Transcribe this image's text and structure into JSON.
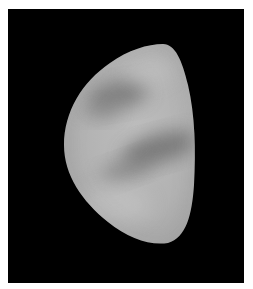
{
  "image": {
    "subject": "planet-gibbous-phase",
    "background_color": "#000000",
    "page_color": "#ffffff",
    "disk_light": "#c4c4c4",
    "disk_mid": "#a8a8a8",
    "band_dark": "#6e6e6e"
  }
}
